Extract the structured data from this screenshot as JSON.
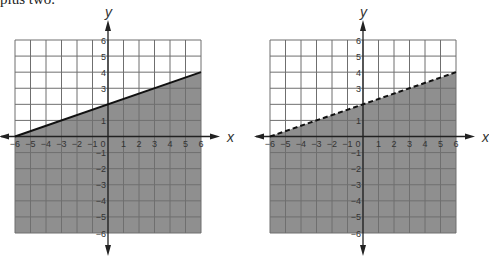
{
  "caption": "plus two.",
  "colors": {
    "shade": "#8f8f8f",
    "grid_light": "#6f6f6f",
    "grid_dark": "#4f4f4f",
    "axis": "#222222",
    "line": "#111111",
    "background": "#ffffff"
  },
  "chart_data": [
    {
      "type": "line",
      "title": "Graph A",
      "boundary": "y = 1/3 x + 2",
      "boundary_style": "solid",
      "shaded": "below",
      "inequality": "y <= 1/3 x + 2",
      "xlabel": "x",
      "ylabel": "y",
      "xlim": [
        -6,
        6
      ],
      "ylim": [
        -6,
        6
      ],
      "grid": true,
      "x_ticks": [
        "-6",
        "-5",
        "-4",
        "-3",
        "-2",
        "-1",
        "0",
        "1",
        "2",
        "3",
        "4",
        "5",
        "6"
      ],
      "y_ticks": [
        "-6",
        "-5",
        "-4",
        "-3",
        "-2",
        "-1",
        "1",
        "3",
        "4",
        "5",
        "6"
      ],
      "line_points": [
        [
          -6,
          0
        ],
        [
          6,
          4
        ]
      ]
    },
    {
      "type": "line",
      "title": "Graph B",
      "boundary": "y = 1/3 x + 2",
      "boundary_style": "dashed",
      "shaded": "below",
      "inequality": "y < 1/3 x + 2",
      "xlabel": "x",
      "ylabel": "y",
      "xlim": [
        -6,
        6
      ],
      "ylim": [
        -6,
        6
      ],
      "grid": true,
      "x_ticks": [
        "-6",
        "-5",
        "-4",
        "-3",
        "-2",
        "-1",
        "0",
        "1",
        "2",
        "3",
        "4",
        "5",
        "6"
      ],
      "y_ticks": [
        "-6",
        "-5",
        "-4",
        "-3",
        "-2",
        "-1",
        "1",
        "3",
        "4",
        "5",
        "6"
      ],
      "line_points": [
        [
          -6,
          0
        ],
        [
          6,
          4
        ]
      ]
    }
  ]
}
